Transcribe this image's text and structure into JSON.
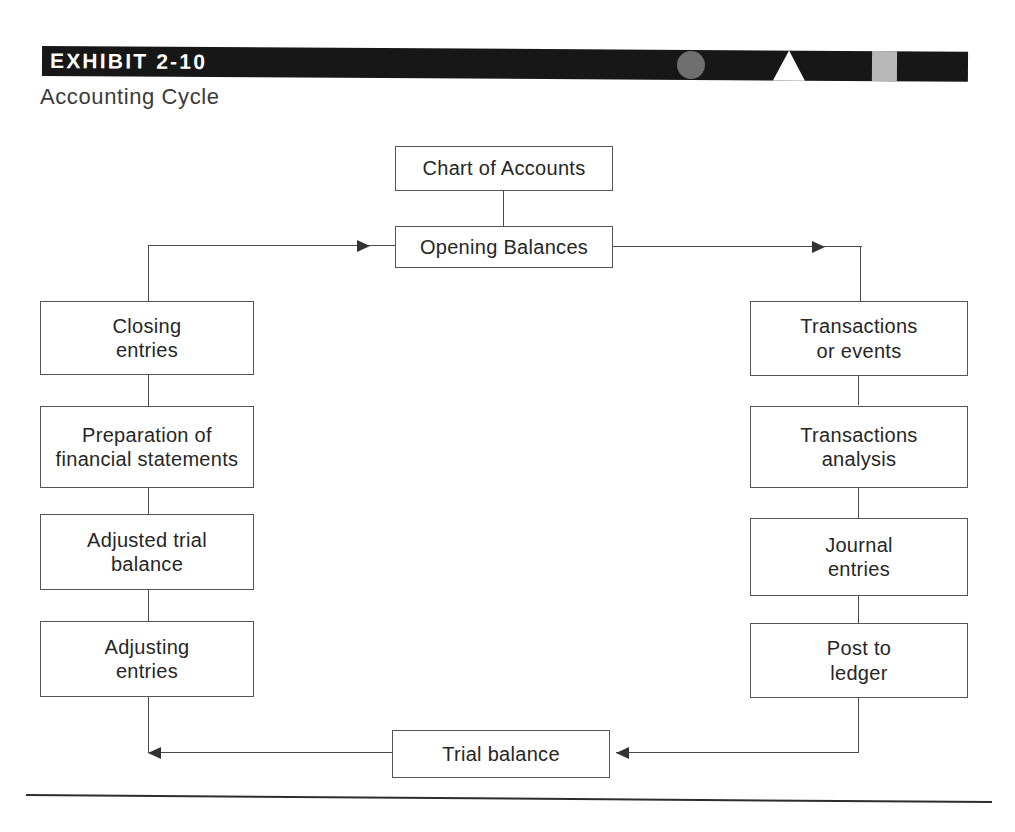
{
  "header": {
    "exhibit_label": "EXHIBIT 2-10",
    "subtitle": "Accounting Cycle",
    "bar_color": "#171717",
    "circle_color": "#6f6f6f",
    "triangle_color": "#ffffff",
    "gray_segment_color": "#b8b8b8",
    "label_color": "#ffffff"
  },
  "diagram": {
    "type": "flowchart",
    "title": "Accounting Cycle",
    "nodes": [
      {
        "id": "chart-of-accounts",
        "label": "Chart of Accounts",
        "column": "top"
      },
      {
        "id": "opening-balances",
        "label": "Opening Balances",
        "column": "top"
      },
      {
        "id": "transactions-events",
        "label": "Transactions\nor events",
        "column": "right"
      },
      {
        "id": "transactions-analysis",
        "label": "Transactions\nanalysis",
        "column": "right"
      },
      {
        "id": "journal-entries",
        "label": "Journal\nentries",
        "column": "right"
      },
      {
        "id": "post-to-ledger",
        "label": "Post to\nledger",
        "column": "right"
      },
      {
        "id": "trial-balance",
        "label": "Trial balance",
        "column": "bottom"
      },
      {
        "id": "adjusting-entries",
        "label": "Adjusting\nentries",
        "column": "left"
      },
      {
        "id": "adjusted-trial-balance",
        "label": "Adjusted trial\nbalance",
        "column": "left"
      },
      {
        "id": "preparation-financial-statements",
        "label": "Preparation of\nfinancial statements",
        "column": "left"
      },
      {
        "id": "closing-entries",
        "label": "Closing\nentries",
        "column": "left"
      }
    ],
    "node_labels": {
      "chart_of_accounts": "Chart of Accounts",
      "opening_balances": "Opening Balances",
      "transactions_events_line1": "Transactions",
      "transactions_events_line2": "or events",
      "transactions_analysis_line1": "Transactions",
      "transactions_analysis_line2": "analysis",
      "journal_entries_line1": "Journal",
      "journal_entries_line2": "entries",
      "post_to_ledger_line1": "Post to",
      "post_to_ledger_line2": "ledger",
      "trial_balance": "Trial balance",
      "adjusting_entries_line1": "Adjusting",
      "adjusting_entries_line2": "entries",
      "adjusted_trial_balance_line1": "Adjusted trial",
      "adjusted_trial_balance_line2": "balance",
      "preparation_line1": "Preparation of",
      "preparation_line2": "financial statements",
      "closing_entries_line1": "Closing",
      "closing_entries_line2": "entries"
    },
    "edges": [
      {
        "from": "chart-of-accounts",
        "to": "opening-balances",
        "arrow": false,
        "direction": "down"
      },
      {
        "from": "opening-balances",
        "to": "transactions-events",
        "arrow": true,
        "direction": "right"
      },
      {
        "from": "transactions-events",
        "to": "transactions-analysis",
        "arrow": false,
        "direction": "down"
      },
      {
        "from": "transactions-analysis",
        "to": "journal-entries",
        "arrow": false,
        "direction": "down"
      },
      {
        "from": "journal-entries",
        "to": "post-to-ledger",
        "arrow": false,
        "direction": "down"
      },
      {
        "from": "post-to-ledger",
        "to": "trial-balance",
        "arrow": true,
        "direction": "left"
      },
      {
        "from": "trial-balance",
        "to": "adjusting-entries",
        "arrow": true,
        "direction": "left"
      },
      {
        "from": "adjusting-entries",
        "to": "adjusted-trial-balance",
        "arrow": false,
        "direction": "up"
      },
      {
        "from": "adjusted-trial-balance",
        "to": "preparation-financial-statements",
        "arrow": false,
        "direction": "up"
      },
      {
        "from": "preparation-financial-statements",
        "to": "closing-entries",
        "arrow": false,
        "direction": "up"
      },
      {
        "from": "closing-entries",
        "to": "opening-balances",
        "arrow": true,
        "direction": "right"
      }
    ],
    "line_color": "#4a4a4a",
    "box_border_color": "#555555",
    "text_color": "#262626"
  }
}
